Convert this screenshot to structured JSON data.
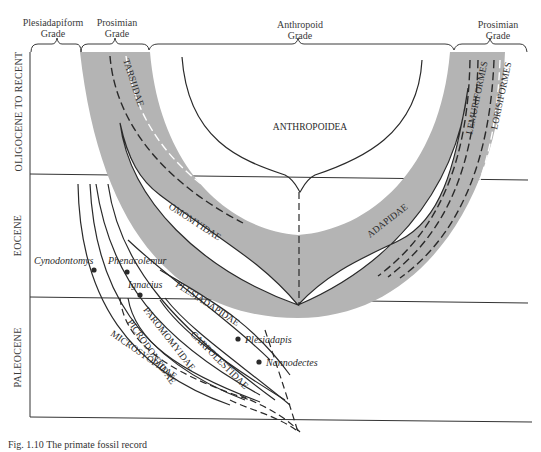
{
  "grades": [
    {
      "label_line1": "Plesiadapiform",
      "label_line2": "Grade"
    },
    {
      "label_line1": "Prosimian",
      "label_line2": "Grade"
    },
    {
      "label_line1": "Anthropoid",
      "label_line2": "Grade"
    },
    {
      "label_line1": "Prosimian",
      "label_line2": "Grade"
    }
  ],
  "epochs": [
    {
      "label": "OLIGOCENE TO RECENT"
    },
    {
      "label": "EOCENE"
    },
    {
      "label": "PALEOCENE"
    }
  ],
  "taxa": {
    "anthropoidea": "ANTHROPOIDEA",
    "tarsiidae": "TARSIIDAE",
    "omomyidae": "OMOMYIDAE",
    "adapidae": "ADAPIDAE",
    "lemuriformes": "LEMURIFORMES",
    "lorisiformes": "LORISIFORMES",
    "plesiadapidae": "PLESIADAPIDAE",
    "paromomyidae": "PAROMOMYIDAE",
    "carpolestidae": "CARPOLESTIDAE",
    "picrodontidae": "PICRODONTIDAE",
    "microsyopidae": "MICROSYOPIDAE"
  },
  "genera": {
    "cynodontomys": "Cynodontomys",
    "phenacolemur": "Phenacolemur",
    "ignacius": "Ignacius",
    "plesiadapis": "Plesiadapis",
    "nannodectes": "Nannodectes"
  },
  "caption": "Fig. 1.10   The primate fossil record",
  "colors": {
    "shade": "#b4b4b4",
    "line": "#2a2a2a"
  }
}
